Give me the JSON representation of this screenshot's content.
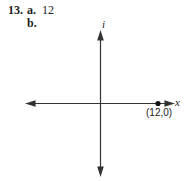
{
  "problem": {
    "number": "13.",
    "part_a": {
      "label": "a.",
      "answer": "12"
    },
    "part_b": {
      "label": "b."
    }
  },
  "graph": {
    "vertical_axis_label": "i",
    "horizontal_axis_label": "x",
    "point": {
      "label": "(12,0)",
      "x": 12,
      "y": 0
    },
    "colors": {
      "axis": "#333333",
      "point": "#111111"
    }
  }
}
